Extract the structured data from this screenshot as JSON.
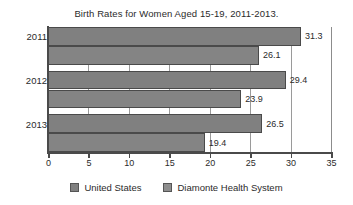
{
  "chart_data": {
    "type": "bar",
    "orientation": "horizontal",
    "title": "Birth Rates for Women Aged 15-19, 2011-2013.",
    "xlabel": "",
    "ylabel": "",
    "xlim": [
      0,
      35
    ],
    "xticks": [
      0,
      5,
      10,
      15,
      20,
      25,
      30,
      35
    ],
    "xtick_labels": [
      "0",
      "5",
      "10",
      "15",
      "20",
      "25",
      "30",
      "35"
    ],
    "categories": [
      "2011",
      "2012",
      "2013"
    ],
    "grid": "vertical",
    "legend_position": "bottom",
    "series": [
      {
        "name": "United States",
        "color": "#808080",
        "values": [
          31.3,
          29.4,
          26.5
        ],
        "value_labels": [
          "31.3",
          "29.4",
          "26.5"
        ]
      },
      {
        "name": "Diamonte Health System",
        "color": "#8e8e8e",
        "values": [
          26.1,
          23.9,
          19.4
        ],
        "value_labels": [
          "26.1",
          "23.9",
          "19.4"
        ]
      }
    ]
  },
  "legend": {
    "items": [
      {
        "label": "United States"
      },
      {
        "label": "Diamonte Health System"
      }
    ]
  }
}
